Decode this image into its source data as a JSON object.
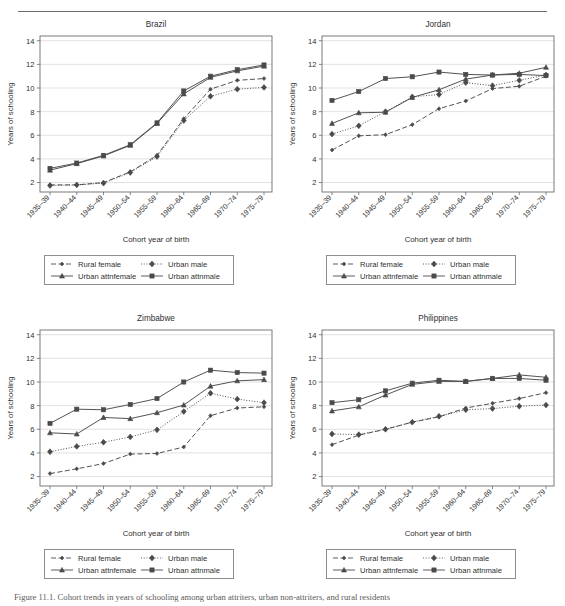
{
  "figure": {
    "caption": "Figure 11.1.  Cohort trends in years of schooling among urban attriters, urban non-attriters, and rural residents",
    "x_axis_label": "Cohort year of birth",
    "y_axis_label": "Years of schooling",
    "y_ticks": [
      2,
      4,
      6,
      8,
      10,
      12,
      14
    ],
    "ylim": [
      1.2,
      14.4
    ],
    "categories": [
      "1935–39",
      "1940–44",
      "1945–49",
      "1950–54",
      "1955–59",
      "1960–64",
      "1965–69",
      "1970–74",
      "1975–79"
    ],
    "series_names": [
      "Rural female",
      "Urban male",
      "Urban attnfemale",
      "Urban attnmale"
    ],
    "legend": {
      "items": [
        {
          "label": "Rural female",
          "key": "dashed-diamond-small",
          "color": "#4a4a4a"
        },
        {
          "label": "Urban male",
          "key": "dotted-diamond",
          "color": "#4a4a4a"
        },
        {
          "label": "Urban attnfemale",
          "key": "solid-triangle",
          "color": "#4a4a4a"
        },
        {
          "label": "Urban attnmale",
          "key": "solid-square",
          "color": "#4a4a4a"
        }
      ]
    },
    "colors": {
      "line": "#4a4a4a",
      "axis": "#6b6b6b",
      "grid": "#d4d4d4",
      "text": "#2f2f2f"
    }
  },
  "chart_data": [
    {
      "type": "line",
      "title": "Brazil",
      "xlabel": "Cohort year of birth",
      "ylabel": "Years of schooling",
      "categories": [
        "1935–39",
        "1940–44",
        "1945–49",
        "1950–54",
        "1955–59",
        "1960–64",
        "1965–69",
        "1970–74",
        "1975–79"
      ],
      "ylim": [
        1.2,
        14.4
      ],
      "yticks": [
        2,
        4,
        6,
        8,
        10,
        12,
        14
      ],
      "grid": true,
      "legend_position": "below",
      "series": [
        {
          "name": "Rural female",
          "style": "dashed",
          "marker": "diamond-small",
          "values": [
            1.8,
            1.8,
            2.0,
            2.9,
            4.3,
            7.4,
            9.9,
            10.65,
            10.8
          ]
        },
        {
          "name": "Urban male",
          "style": "dotted",
          "marker": "diamond",
          "values": [
            1.75,
            1.8,
            1.95,
            2.85,
            4.2,
            7.25,
            9.3,
            9.9,
            10.05
          ]
        },
        {
          "name": "Urban attnfemale",
          "style": "solid",
          "marker": "triangle",
          "values": [
            3.05,
            3.6,
            4.25,
            5.15,
            7.0,
            9.5,
            10.9,
            11.45,
            11.85
          ]
        },
        {
          "name": "Urban attnmale",
          "style": "solid",
          "marker": "square",
          "values": [
            3.2,
            3.65,
            4.3,
            5.2,
            7.05,
            9.75,
            11.0,
            11.55,
            11.95
          ]
        }
      ]
    },
    {
      "type": "line",
      "title": "Jordan",
      "xlabel": "Cohort year of birth",
      "ylabel": "Years of schooling",
      "categories": [
        "1935–39",
        "1940–44",
        "1945–49",
        "1950–54",
        "1955–59",
        "1960–64",
        "1965–69",
        "1970–74",
        "1975–79"
      ],
      "ylim": [
        1.2,
        14.4
      ],
      "yticks": [
        2,
        4,
        6,
        8,
        10,
        12,
        14
      ],
      "grid": true,
      "legend_position": "below",
      "series": [
        {
          "name": "Rural female",
          "style": "dashed",
          "marker": "diamond-small",
          "values": [
            4.75,
            5.95,
            6.05,
            6.9,
            8.25,
            8.9,
            9.95,
            10.15,
            11.0
          ]
        },
        {
          "name": "Urban male",
          "style": "dotted",
          "marker": "diamond",
          "values": [
            6.1,
            6.8,
            8.0,
            9.25,
            9.45,
            10.45,
            10.2,
            10.65,
            11.1
          ]
        },
        {
          "name": "Urban attnfemale",
          "style": "solid",
          "marker": "triangle",
          "values": [
            7.0,
            7.9,
            7.95,
            9.2,
            9.85,
            10.75,
            11.1,
            11.25,
            11.75
          ]
        },
        {
          "name": "Urban attnmale",
          "style": "solid",
          "marker": "square",
          "values": [
            8.95,
            9.7,
            10.8,
            10.95,
            11.35,
            11.15,
            11.1,
            11.15,
            11.05
          ]
        }
      ]
    },
    {
      "type": "line",
      "title": "Zimbabwe",
      "xlabel": "Cohort year of birth",
      "ylabel": "Years of schooling",
      "categories": [
        "1935–39",
        "1940–44",
        "1945–49",
        "1950–54",
        "1955–59",
        "1960–64",
        "1965–69",
        "1970–74",
        "1975–79"
      ],
      "ylim": [
        1.2,
        14.4
      ],
      "yticks": [
        2,
        4,
        6,
        8,
        10,
        12,
        14
      ],
      "grid": true,
      "legend_position": "below",
      "series": [
        {
          "name": "Rural female",
          "style": "dashed",
          "marker": "diamond-small",
          "values": [
            2.25,
            2.65,
            3.1,
            3.9,
            3.95,
            4.5,
            7.15,
            7.8,
            7.9
          ]
        },
        {
          "name": "Urban male",
          "style": "dotted",
          "marker": "diamond",
          "values": [
            4.1,
            4.55,
            4.9,
            5.35,
            5.95,
            7.5,
            9.05,
            8.55,
            8.25
          ]
        },
        {
          "name": "Urban attnfemale",
          "style": "solid",
          "marker": "triangle",
          "values": [
            5.7,
            5.6,
            7.0,
            6.9,
            7.4,
            8.05,
            9.65,
            10.1,
            10.2
          ]
        },
        {
          "name": "Urban attnmale",
          "style": "solid",
          "marker": "square",
          "values": [
            6.5,
            7.7,
            7.65,
            8.1,
            8.6,
            10.0,
            11.0,
            10.8,
            10.75
          ]
        }
      ]
    },
    {
      "type": "line",
      "title": "Philippines",
      "xlabel": "Cohort year of birth",
      "ylabel": "Years of schooling",
      "categories": [
        "1935–39",
        "1940–44",
        "1945–49",
        "1950–54",
        "1955–59",
        "1960–64",
        "1965–69",
        "1970–74",
        "1975–79"
      ],
      "ylim": [
        1.2,
        14.4
      ],
      "yticks": [
        2,
        4,
        6,
        8,
        10,
        12,
        14
      ],
      "grid": true,
      "legend_position": "below",
      "series": [
        {
          "name": "Rural female",
          "style": "dashed",
          "marker": "diamond-small",
          "values": [
            4.7,
            5.5,
            6.0,
            6.6,
            7.05,
            7.8,
            8.2,
            8.6,
            9.1
          ]
        },
        {
          "name": "Urban male",
          "style": "dotted",
          "marker": "diamond",
          "values": [
            5.6,
            5.55,
            6.0,
            6.6,
            7.1,
            7.65,
            7.75,
            7.95,
            8.05
          ]
        },
        {
          "name": "Urban attnfemale",
          "style": "solid",
          "marker": "triangle",
          "values": [
            7.55,
            7.9,
            8.9,
            9.8,
            10.05,
            10.05,
            10.3,
            10.6,
            10.4
          ]
        },
        {
          "name": "Urban attnmale",
          "style": "solid",
          "marker": "square",
          "values": [
            8.25,
            8.5,
            9.25,
            9.9,
            10.15,
            10.05,
            10.3,
            10.3,
            10.15
          ]
        }
      ]
    }
  ]
}
